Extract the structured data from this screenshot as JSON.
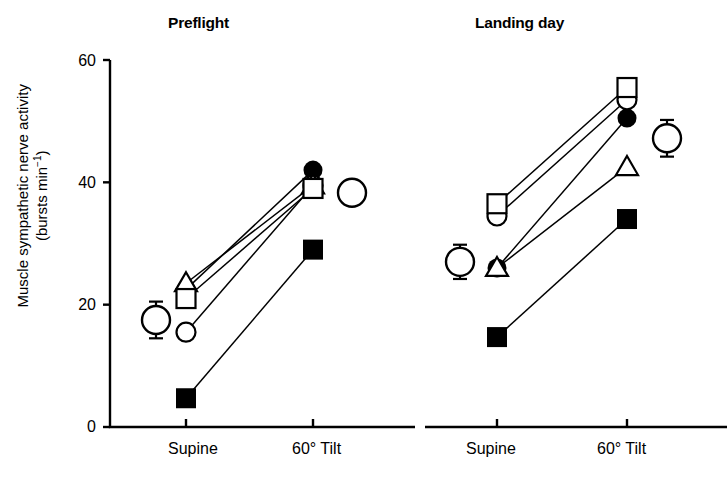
{
  "figure": {
    "axis_color": "#000000",
    "marker_color": "#000000",
    "panels": [
      {
        "id": "preflight",
        "title": "Preflight"
      },
      {
        "id": "landing-day",
        "title": "Landing day"
      }
    ]
  },
  "yaxis": {
    "label_line1": "Muscle sympathetic nerve activity",
    "label_line2_pre": "(bursts min",
    "label_line2_sup": "−1",
    "label_line2_post": ")",
    "ticks": [
      "0",
      "20",
      "40",
      "60"
    ],
    "min": 0,
    "max": 60
  },
  "xaxis": {
    "ticks": [
      "Supine",
      "60° Tilt"
    ]
  },
  "chart_data": {
    "type": "line",
    "xlabel": "",
    "ylabel": "Muscle sympathetic nerve activity (bursts min−1)",
    "ylim": [
      0,
      60
    ],
    "yticks": [
      0,
      20,
      40,
      60
    ],
    "x": [
      "Supine",
      "60° Tilt"
    ],
    "grid": false,
    "legend": "none",
    "panels": [
      {
        "name": "Preflight",
        "series": [
          {
            "name": "Subject 1",
            "marker": "filled-circle",
            "values": [
              22.5,
              42.0
            ]
          },
          {
            "name": "Subject 2",
            "marker": "open-circle",
            "values": [
              15.5,
              39.5
            ]
          },
          {
            "name": "Subject 3",
            "marker": "open-triangle",
            "values": [
              23.5,
              39.5
            ]
          },
          {
            "name": "Subject 4",
            "marker": "open-square",
            "values": [
              21.0,
              39.0
            ]
          },
          {
            "name": "Subject 5",
            "marker": "filled-square",
            "values": [
              4.7,
              29.0
            ]
          },
          {
            "name": "Mean ± S.E.M.",
            "marker": "large-open-circle-errorbar",
            "values": [
              17.5,
              38.3
            ],
            "errors": [
              3.0,
              1.2
            ]
          }
        ]
      },
      {
        "name": "Landing day",
        "series": [
          {
            "name": "Subject 1",
            "marker": "filled-circle",
            "values": [
              26.0,
              50.5
            ]
          },
          {
            "name": "Subject 2",
            "marker": "open-circle",
            "values": [
              34.5,
              53.5
            ]
          },
          {
            "name": "Subject 3",
            "marker": "open-triangle",
            "values": [
              26.0,
              42.5
            ]
          },
          {
            "name": "Subject 4",
            "marker": "open-square",
            "values": [
              36.5,
              55.5
            ]
          },
          {
            "name": "Subject 5",
            "marker": "filled-square",
            "values": [
              14.7,
              34.0
            ]
          },
          {
            "name": "Mean ± S.E.M.",
            "marker": "large-open-circle-errorbar",
            "values": [
              27.0,
              47.2
            ],
            "errors": [
              2.8,
              3.0
            ]
          }
        ]
      }
    ]
  }
}
